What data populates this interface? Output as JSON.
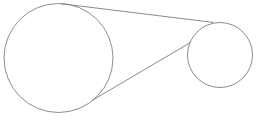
{
  "figure": {
    "name": "two-circles-with-tangent-lines",
    "title": "Two circles joined by tangent lines",
    "canvas": {
      "width": 261,
      "height": 124,
      "background_color": "#ffffff"
    },
    "style": {
      "stroke_color": "#808080",
      "tangent_stroke_color": "#7d7d7d",
      "stroke_width": 0.9,
      "fill": "none"
    },
    "shapes": [
      {
        "id": "large-circle",
        "type": "circle",
        "label": "Large circle",
        "cx": 58.5,
        "cy": 58,
        "r": 54.5
      },
      {
        "id": "small-circle",
        "type": "circle",
        "label": "Small circle",
        "cx": 220,
        "cy": 55,
        "r": 32.5
      }
    ],
    "lines": [
      {
        "id": "upper-tangent",
        "type": "line",
        "label": "Upper tangent line",
        "x1": 61,
        "y1": 3.7,
        "x2": 213,
        "y2": 22.4
      },
      {
        "id": "lower-tangent",
        "type": "line",
        "label": "Lower tangent line",
        "x1": 92,
        "y1": 100.5,
        "x2": 190.5,
        "y2": 42.5
      }
    ]
  }
}
